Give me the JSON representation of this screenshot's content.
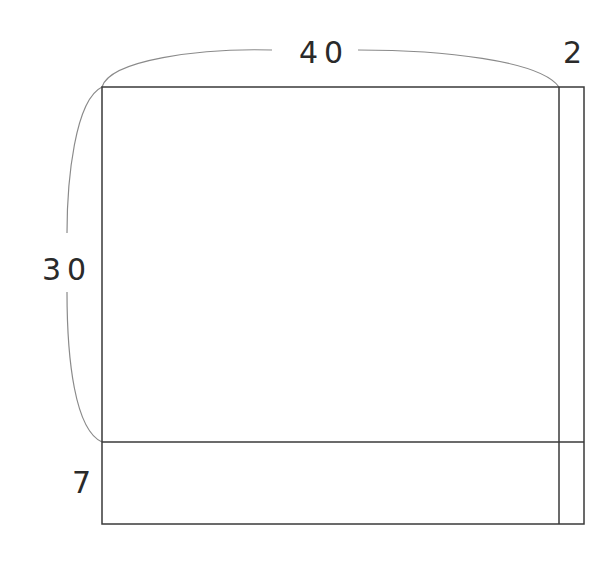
{
  "diagram": {
    "type": "dimensioned-rectangle-layout",
    "dimensions": {
      "top_width": "40",
      "right_strip_width": "2",
      "left_height": "30",
      "bottom_strip_height": "7"
    },
    "colors": {
      "line": "#3a3a3a",
      "bracket": "#8a8a8a",
      "text": "#2a2a2a",
      "background": "#ffffff"
    }
  }
}
